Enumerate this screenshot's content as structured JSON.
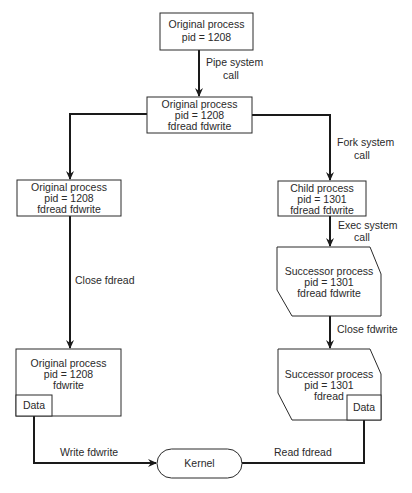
{
  "nodes": {
    "original_initial": {
      "lines": [
        "Original process",
        "pid = 1208"
      ]
    },
    "original_piped": {
      "lines": [
        "Original process",
        "pid = 1208",
        "fdread fdwrite"
      ]
    },
    "original_left": {
      "lines": [
        "Original process",
        "pid = 1208",
        "fdread fdwrite"
      ]
    },
    "child": {
      "lines": [
        "Child process",
        "pid = 1301",
        "fdread fdwrite"
      ]
    },
    "successor_exec": {
      "lines": [
        "Successor process",
        "pid = 1301",
        "fdread fdwrite"
      ]
    },
    "original_writer": {
      "lines": [
        "Original process",
        "pid = 1208",
        "fdwrite"
      ],
      "data_label": "Data"
    },
    "successor_reader": {
      "lines": [
        "Successor process",
        "pid = 1301",
        "fdread"
      ],
      "data_label": "Data"
    },
    "kernel": {
      "label": "Kernel"
    }
  },
  "edges": {
    "pipe": {
      "lines": [
        "Pipe system",
        "call"
      ]
    },
    "fork": {
      "lines": [
        "Fork system",
        "call"
      ]
    },
    "exec": {
      "lines": [
        "Exec system",
        "call"
      ]
    },
    "close_fdread": {
      "label": "Close fdread"
    },
    "close_fdwrite": {
      "label": "Close fdwrite"
    },
    "write": {
      "label": "Write fdwrite"
    },
    "read": {
      "label": "Read fdread"
    }
  }
}
